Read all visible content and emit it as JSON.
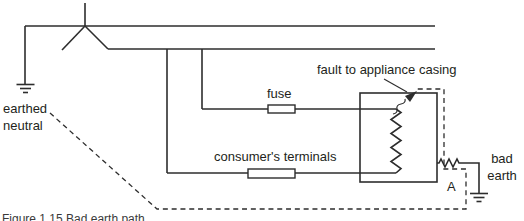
{
  "colors": {
    "line": "#2d2d2d",
    "text": "#231f20",
    "background": "#ffffff"
  },
  "labels": {
    "earthed_neutral": "earthed\nneutral",
    "fuse": "fuse",
    "consumers_terminals": "consumer's terminals",
    "fault": "fault to appliance casing",
    "bad_earth": "bad\nearth",
    "ammeter": "A"
  },
  "caption": "Figure 1.15 Bad earth path",
  "symbols": [
    "transformer-star-point-icon",
    "earth-ground-icon-left",
    "fuse-icon",
    "consumer-terminals-block-icon",
    "appliance-casing-box",
    "heating-element-coil-icon",
    "bad-earth-resistor-icon",
    "earth-ground-icon-right",
    "fault-arrow-icon",
    "fault-current-dashed-path"
  ]
}
